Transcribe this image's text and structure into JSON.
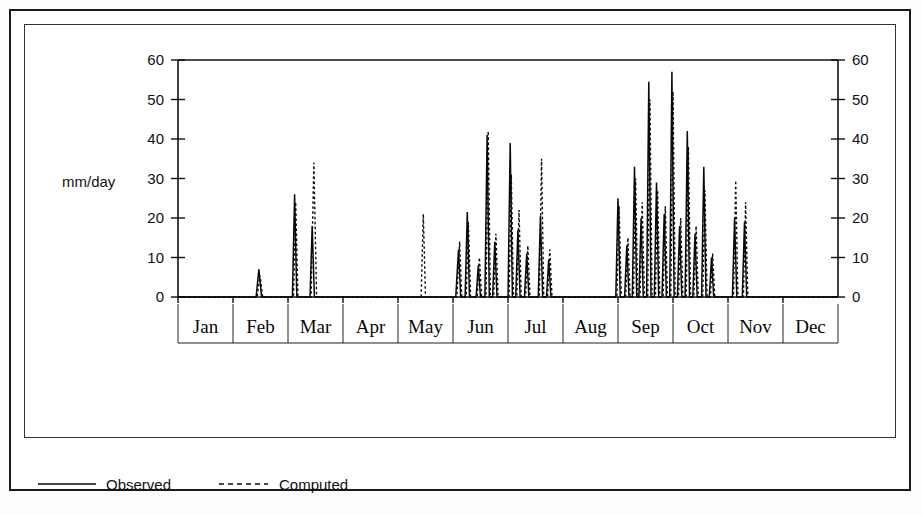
{
  "chart_data": {
    "type": "line",
    "title": "",
    "subtitle": "",
    "xlabel": "",
    "ylabel": "mm/day",
    "ylim": [
      0,
      60
    ],
    "yticks": [
      0,
      10,
      20,
      30,
      40,
      50,
      60
    ],
    "ytick_labels": [
      "0",
      "10",
      "20",
      "30",
      "40",
      "50",
      "60"
    ],
    "right_axis": {
      "present": true,
      "ticks": [
        0,
        10,
        20,
        30,
        40,
        50,
        60
      ],
      "tick_labels": [
        "0",
        "10",
        "20",
        "30",
        "40",
        "50",
        "60"
      ]
    },
    "grid": false,
    "legend_position": "below-plot",
    "categories": [
      "Jan",
      "Feb",
      "Mar",
      "Apr",
      "May",
      "Jun",
      "Jul",
      "Aug",
      "Sep",
      "Oct",
      "Nov",
      "Dec"
    ],
    "x_axis_note": "daily values across one year, month dividers drawn on category boundaries",
    "series": [
      {
        "name": "Observed",
        "style": "solid",
        "color": "#0a0a0a",
        "points": [
          [
            0.0,
            0
          ],
          [
            1.0,
            0
          ],
          [
            1.42,
            0
          ],
          [
            1.47,
            7.0
          ],
          [
            1.52,
            0
          ],
          [
            1.95,
            0
          ],
          [
            2.08,
            0
          ],
          [
            2.12,
            26.0
          ],
          [
            2.16,
            0
          ],
          [
            2.4,
            0
          ],
          [
            2.44,
            18.0
          ],
          [
            2.48,
            0
          ],
          [
            2.6,
            0
          ],
          [
            4.9,
            0
          ],
          [
            5.05,
            0
          ],
          [
            5.1,
            12.0
          ],
          [
            5.14,
            0
          ],
          [
            5.22,
            0
          ],
          [
            5.26,
            21.5
          ],
          [
            5.3,
            0
          ],
          [
            5.42,
            0
          ],
          [
            5.46,
            8.0
          ],
          [
            5.5,
            0
          ],
          [
            5.58,
            0
          ],
          [
            5.62,
            41.0
          ],
          [
            5.66,
            0
          ],
          [
            5.72,
            0
          ],
          [
            5.76,
            14.0
          ],
          [
            5.8,
            0
          ],
          [
            6.0,
            0
          ],
          [
            6.04,
            39.0
          ],
          [
            6.08,
            0
          ],
          [
            6.14,
            0
          ],
          [
            6.18,
            17.0
          ],
          [
            6.22,
            0
          ],
          [
            6.3,
            0
          ],
          [
            6.34,
            11.0
          ],
          [
            6.38,
            0
          ],
          [
            6.55,
            0
          ],
          [
            6.59,
            20.5
          ],
          [
            6.63,
            0
          ],
          [
            6.7,
            0
          ],
          [
            6.74,
            9.5
          ],
          [
            6.78,
            0
          ],
          [
            6.9,
            0
          ],
          [
            7.9,
            0
          ],
          [
            7.96,
            0
          ],
          [
            8.0,
            25.0
          ],
          [
            8.04,
            0
          ],
          [
            8.12,
            0
          ],
          [
            8.16,
            13.0
          ],
          [
            8.2,
            0
          ],
          [
            8.26,
            0
          ],
          [
            8.3,
            33.0
          ],
          [
            8.34,
            0
          ],
          [
            8.38,
            0
          ],
          [
            8.42,
            20.0
          ],
          [
            8.46,
            0
          ],
          [
            8.52,
            0
          ],
          [
            8.56,
            54.5
          ],
          [
            8.6,
            0
          ],
          [
            8.66,
            0
          ],
          [
            8.7,
            29.0
          ],
          [
            8.74,
            0
          ],
          [
            8.8,
            0
          ],
          [
            8.84,
            21.0
          ],
          [
            8.88,
            0
          ],
          [
            8.94,
            0
          ],
          [
            8.98,
            57.0
          ],
          [
            9.02,
            0
          ],
          [
            9.08,
            0
          ],
          [
            9.12,
            18.0
          ],
          [
            9.16,
            0
          ],
          [
            9.22,
            0
          ],
          [
            9.26,
            42.0
          ],
          [
            9.3,
            0
          ],
          [
            9.36,
            0
          ],
          [
            9.4,
            16.0
          ],
          [
            9.44,
            0
          ],
          [
            9.52,
            0
          ],
          [
            9.56,
            33.0
          ],
          [
            9.6,
            0
          ],
          [
            9.66,
            0
          ],
          [
            9.7,
            10.0
          ],
          [
            9.74,
            0
          ],
          [
            9.9,
            0
          ],
          [
            10.08,
            0
          ],
          [
            10.12,
            20.0
          ],
          [
            10.16,
            0
          ],
          [
            10.26,
            0
          ],
          [
            10.3,
            19.0
          ],
          [
            10.34,
            0
          ],
          [
            10.5,
            0
          ],
          [
            12.0,
            0
          ]
        ]
      },
      {
        "name": "Computed",
        "style": "dashed",
        "color": "#0a0a0a",
        "points": [
          [
            0.0,
            0
          ],
          [
            1.0,
            0
          ],
          [
            1.44,
            0
          ],
          [
            1.49,
            5.5
          ],
          [
            1.54,
            0
          ],
          [
            1.95,
            0
          ],
          [
            2.1,
            0
          ],
          [
            2.14,
            24.0
          ],
          [
            2.18,
            0
          ],
          [
            2.42,
            0
          ],
          [
            2.47,
            34.0
          ],
          [
            2.52,
            0
          ],
          [
            2.6,
            0
          ],
          [
            4.35,
            0
          ],
          [
            4.42,
            0
          ],
          [
            4.46,
            21.0
          ],
          [
            4.5,
            0
          ],
          [
            4.6,
            0
          ],
          [
            5.02,
            0
          ],
          [
            5.07,
            0
          ],
          [
            5.12,
            14.0
          ],
          [
            5.16,
            0
          ],
          [
            5.24,
            0
          ],
          [
            5.28,
            19.0
          ],
          [
            5.32,
            0
          ],
          [
            5.44,
            0
          ],
          [
            5.48,
            10.0
          ],
          [
            5.52,
            0
          ],
          [
            5.6,
            0
          ],
          [
            5.64,
            42.0
          ],
          [
            5.68,
            0
          ],
          [
            5.74,
            0
          ],
          [
            5.78,
            16.0
          ],
          [
            5.82,
            0
          ],
          [
            6.02,
            0
          ],
          [
            6.06,
            31.0
          ],
          [
            6.1,
            0
          ],
          [
            6.16,
            0
          ],
          [
            6.2,
            22.0
          ],
          [
            6.24,
            0
          ],
          [
            6.32,
            0
          ],
          [
            6.36,
            13.0
          ],
          [
            6.4,
            0
          ],
          [
            6.57,
            0
          ],
          [
            6.61,
            35.0
          ],
          [
            6.65,
            0
          ],
          [
            6.72,
            0
          ],
          [
            6.76,
            12.0
          ],
          [
            6.8,
            0
          ],
          [
            6.9,
            0
          ],
          [
            7.9,
            0
          ],
          [
            7.98,
            0
          ],
          [
            8.02,
            23.0
          ],
          [
            8.06,
            0
          ],
          [
            8.14,
            0
          ],
          [
            8.18,
            15.0
          ],
          [
            8.22,
            0
          ],
          [
            8.28,
            0
          ],
          [
            8.32,
            30.0
          ],
          [
            8.36,
            0
          ],
          [
            8.4,
            0
          ],
          [
            8.44,
            24.0
          ],
          [
            8.48,
            0
          ],
          [
            8.54,
            0
          ],
          [
            8.58,
            50.0
          ],
          [
            8.62,
            0
          ],
          [
            8.68,
            0
          ],
          [
            8.72,
            27.0
          ],
          [
            8.76,
            0
          ],
          [
            8.82,
            0
          ],
          [
            8.86,
            23.0
          ],
          [
            8.9,
            0
          ],
          [
            8.96,
            0
          ],
          [
            9.0,
            52.0
          ],
          [
            9.04,
            0
          ],
          [
            9.1,
            0
          ],
          [
            9.14,
            20.0
          ],
          [
            9.18,
            0
          ],
          [
            9.24,
            0
          ],
          [
            9.28,
            38.0
          ],
          [
            9.32,
            0
          ],
          [
            9.38,
            0
          ],
          [
            9.42,
            18.0
          ],
          [
            9.46,
            0
          ],
          [
            9.54,
            0
          ],
          [
            9.58,
            27.0
          ],
          [
            9.62,
            0
          ],
          [
            9.68,
            0
          ],
          [
            9.72,
            11.0
          ],
          [
            9.76,
            0
          ],
          [
            9.9,
            0
          ],
          [
            10.1,
            0
          ],
          [
            10.14,
            29.5
          ],
          [
            10.18,
            0
          ],
          [
            10.28,
            0
          ],
          [
            10.32,
            24.0
          ],
          [
            10.36,
            0
          ],
          [
            10.5,
            0
          ],
          [
            12.0,
            0
          ]
        ]
      }
    ],
    "annotations": []
  },
  "legend": {
    "entries": [
      {
        "label": "Observed",
        "style": "solid"
      },
      {
        "label": "Computed",
        "style": "dashed"
      }
    ]
  }
}
